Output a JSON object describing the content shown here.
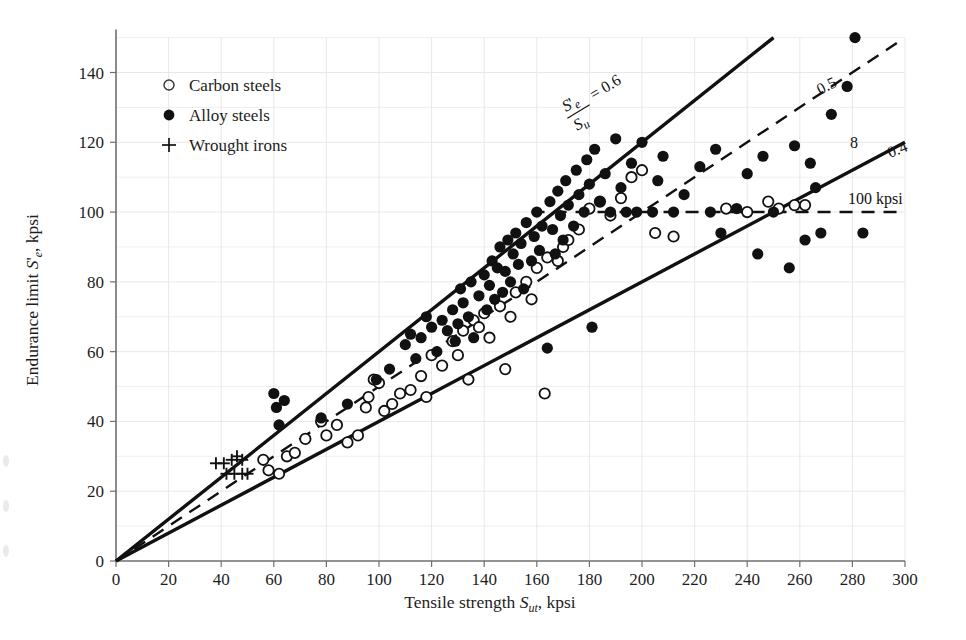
{
  "figure": {
    "background_color": "#ffffff",
    "grid_color": "#e8e8e8",
    "axis_color": "#6f6f6f",
    "ink_color": "#111111"
  },
  "axes": {
    "x": {
      "label_prefix": "Tensile strength ",
      "label_var": "S",
      "label_sub": "ut",
      "label_suffix": ", kpsi",
      "ticks": [
        0,
        20,
        40,
        60,
        80,
        100,
        120,
        140,
        160,
        180,
        200,
        220,
        240,
        260,
        280,
        300
      ],
      "min": 0,
      "max": 300,
      "units": "kpsi"
    },
    "y": {
      "label_prefix": "Endurance limit ",
      "label_var": "S",
      "label_prime": "'",
      "label_sub": "e",
      "label_suffix": ", kpsi",
      "ticks": [
        0,
        20,
        40,
        60,
        80,
        100,
        120,
        140
      ],
      "min": 0,
      "max": 150,
      "units": "kpsi"
    }
  },
  "legend": {
    "items": [
      {
        "marker": "open-circle",
        "label": "Carbon steels"
      },
      {
        "marker": "filled-circle",
        "label": "Alloy steels"
      },
      {
        "marker": "plus",
        "label": "Wrought irons"
      }
    ]
  },
  "annotations": {
    "ratio_numerator": "S",
    "ratio_numerator_prime": "'",
    "ratio_numerator_sub": "e",
    "ratio_denominator": "S",
    "ratio_denominator_sub": "u",
    "ratio_equals": "= 0.6",
    "line_05": "0.5",
    "line_04": "0.4",
    "stray_mark": "8",
    "horizontal_limit": "100 kpsi"
  },
  "chart_data": {
    "type": "scatter",
    "title": "",
    "xlabel": "Tensile strength S_ut, kpsi",
    "ylabel": "Endurance limit S'_e, kpsi",
    "xlim": [
      0,
      300
    ],
    "ylim": [
      0,
      150
    ],
    "grid": true,
    "legend_position": "upper-left-inside",
    "reference_lines": [
      {
        "name": "ratio-0.6",
        "type": "solid",
        "slope": 0.6,
        "intercept": 0,
        "x_range": [
          0,
          250
        ],
        "label": "S'e/Su = 0.6"
      },
      {
        "name": "ratio-0.5",
        "type": "dashed",
        "slope": 0.5,
        "intercept": 0,
        "x_range": [
          0,
          297
        ],
        "label": "0.5"
      },
      {
        "name": "ratio-0.4",
        "type": "solid",
        "slope": 0.4,
        "intercept": 0,
        "x_range": [
          0,
          300
        ],
        "label": "0.4"
      },
      {
        "name": "endurance-cap",
        "type": "dashed",
        "slope": 0,
        "intercept": 100,
        "x_range": [
          158,
          300
        ],
        "label": "100 kpsi"
      }
    ],
    "series": [
      {
        "name": "Carbon steels",
        "marker": "open-circle",
        "points": [
          [
            56,
            29
          ],
          [
            58,
            26
          ],
          [
            62,
            25
          ],
          [
            65,
            30
          ],
          [
            68,
            31
          ],
          [
            72,
            35
          ],
          [
            78,
            40
          ],
          [
            80,
            36
          ],
          [
            84,
            39
          ],
          [
            88,
            34
          ],
          [
            92,
            36
          ],
          [
            95,
            44
          ],
          [
            96,
            47
          ],
          [
            98,
            52
          ],
          [
            100,
            51
          ],
          [
            102,
            43
          ],
          [
            105,
            45
          ],
          [
            108,
            48
          ],
          [
            112,
            49
          ],
          [
            116,
            53
          ],
          [
            118,
            47
          ],
          [
            120,
            59
          ],
          [
            124,
            56
          ],
          [
            128,
            63
          ],
          [
            130,
            59
          ],
          [
            132,
            66
          ],
          [
            134,
            52
          ],
          [
            136,
            69
          ],
          [
            138,
            67
          ],
          [
            140,
            71
          ],
          [
            142,
            64
          ],
          [
            146,
            73
          ],
          [
            148,
            55
          ],
          [
            150,
            70
          ],
          [
            152,
            77
          ],
          [
            156,
            80
          ],
          [
            158,
            75
          ],
          [
            160,
            84
          ],
          [
            163,
            48
          ],
          [
            164,
            87
          ],
          [
            168,
            86
          ],
          [
            170,
            90
          ],
          [
            172,
            92
          ],
          [
            176,
            95
          ],
          [
            180,
            101
          ],
          [
            184,
            103
          ],
          [
            188,
            99
          ],
          [
            192,
            104
          ],
          [
            196,
            110
          ],
          [
            200,
            112
          ],
          [
            205,
            94
          ],
          [
            212,
            93
          ],
          [
            232,
            101
          ],
          [
            240,
            100
          ],
          [
            248,
            103
          ],
          [
            252,
            101
          ],
          [
            258,
            102
          ],
          [
            262,
            102
          ]
        ]
      },
      {
        "name": "Alloy steels",
        "marker": "filled-circle",
        "points": [
          [
            60,
            48
          ],
          [
            61,
            44
          ],
          [
            62,
            39
          ],
          [
            64,
            46
          ],
          [
            78,
            41
          ],
          [
            88,
            45
          ],
          [
            99,
            52
          ],
          [
            104,
            55
          ],
          [
            110,
            62
          ],
          [
            112,
            65
          ],
          [
            114,
            58
          ],
          [
            116,
            64
          ],
          [
            118,
            70
          ],
          [
            120,
            67
          ],
          [
            122,
            60
          ],
          [
            124,
            69
          ],
          [
            126,
            66
          ],
          [
            128,
            72
          ],
          [
            129,
            63
          ],
          [
            130,
            68
          ],
          [
            131,
            78
          ],
          [
            132,
            74
          ],
          [
            134,
            70
          ],
          [
            135,
            80
          ],
          [
            136,
            64
          ],
          [
            138,
            76
          ],
          [
            140,
            82
          ],
          [
            141,
            72
          ],
          [
            142,
            79
          ],
          [
            143,
            86
          ],
          [
            144,
            75
          ],
          [
            145,
            84
          ],
          [
            146,
            90
          ],
          [
            147,
            77
          ],
          [
            148,
            83
          ],
          [
            149,
            92
          ],
          [
            150,
            80
          ],
          [
            151,
            88
          ],
          [
            152,
            94
          ],
          [
            153,
            85
          ],
          [
            154,
            91
          ],
          [
            155,
            78
          ],
          [
            156,
            97
          ],
          [
            158,
            86
          ],
          [
            159,
            93
          ],
          [
            160,
            100
          ],
          [
            161,
            89
          ],
          [
            162,
            96
          ],
          [
            164,
            61
          ],
          [
            165,
            103
          ],
          [
            166,
            95
          ],
          [
            167,
            88
          ],
          [
            168,
            106
          ],
          [
            169,
            99
          ],
          [
            170,
            92
          ],
          [
            171,
            109
          ],
          [
            172,
            102
          ],
          [
            174,
            96
          ],
          [
            175,
            112
          ],
          [
            176,
            105
          ],
          [
            178,
            100
          ],
          [
            179,
            115
          ],
          [
            180,
            108
          ],
          [
            181,
            67
          ],
          [
            182,
            118
          ],
          [
            184,
            103
          ],
          [
            186,
            111
          ],
          [
            188,
            100
          ],
          [
            190,
            121
          ],
          [
            192,
            107
          ],
          [
            194,
            100
          ],
          [
            196,
            114
          ],
          [
            198,
            100
          ],
          [
            200,
            120
          ],
          [
            204,
            100
          ],
          [
            206,
            109
          ],
          [
            208,
            116
          ],
          [
            212,
            100
          ],
          [
            216,
            105
          ],
          [
            222,
            113
          ],
          [
            226,
            100
          ],
          [
            228,
            118
          ],
          [
            230,
            94
          ],
          [
            236,
            101
          ],
          [
            240,
            111
          ],
          [
            244,
            88
          ],
          [
            246,
            116
          ],
          [
            250,
            100
          ],
          [
            256,
            84
          ],
          [
            258,
            119
          ],
          [
            262,
            92
          ],
          [
            264,
            114
          ],
          [
            266,
            107
          ],
          [
            268,
            94
          ],
          [
            272,
            128
          ],
          [
            278,
            136
          ],
          [
            281,
            150
          ],
          [
            284,
            94
          ]
        ]
      },
      {
        "name": "Wrought irons",
        "marker": "plus",
        "points": [
          [
            38,
            28
          ],
          [
            41,
            28
          ],
          [
            44,
            29
          ],
          [
            46,
            30
          ],
          [
            48,
            29
          ],
          [
            42,
            25
          ],
          [
            45,
            25
          ],
          [
            48,
            25
          ],
          [
            50,
            25
          ]
        ]
      }
    ]
  }
}
